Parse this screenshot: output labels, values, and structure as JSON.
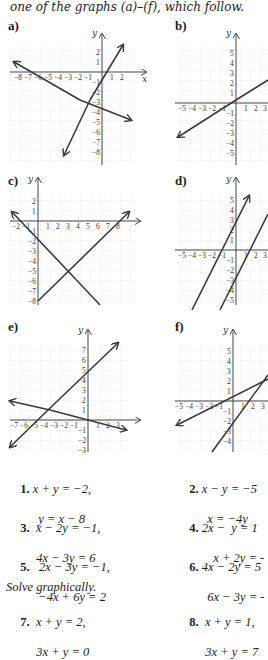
{
  "intro_text": "one of the graphs (a)–(f), which follow.",
  "graphs": [
    {
      "label": "a)",
      "x_ticks": [
        "-8",
        "-7",
        "-6",
        "-5",
        "-4",
        "-3",
        "-2",
        "-1",
        "1",
        "2"
      ],
      "y_ticks": [
        "2",
        "1",
        "-1",
        "-2",
        "-3",
        "-4",
        "-5",
        "-6",
        "-7",
        "-8"
      ]
    },
    {
      "label": "b)",
      "x_ticks": [
        "-5",
        "-4",
        "-3",
        "-2",
        "-1",
        "1",
        "2",
        "3"
      ],
      "y_ticks": [
        "5",
        "4",
        "3",
        "2",
        "1",
        "-1",
        "-2",
        "-3",
        "-4",
        "-5"
      ]
    },
    {
      "label": "c)",
      "x_ticks": [
        "-2",
        "-1",
        "1",
        "2",
        "3",
        "4",
        "5",
        "6",
        "7",
        "8"
      ],
      "y_ticks": [
        "2",
        "1",
        "-1",
        "-2",
        "-3",
        "-4",
        "-5",
        "-6",
        "-7",
        "-8"
      ]
    },
    {
      "label": "d)",
      "x_ticks": [
        "-5",
        "-4",
        "-3",
        "-2",
        "-1",
        "1",
        "2",
        "3"
      ],
      "y_ticks": [
        "5",
        "4",
        "3",
        "2",
        "1",
        "-1",
        "-2",
        "-3",
        "-4",
        "-5"
      ]
    },
    {
      "label": "e)",
      "x_ticks": [
        "-7",
        "-6",
        "-5",
        "-4",
        "-3",
        "-2",
        "-1",
        "1",
        "2",
        "3"
      ],
      "y_ticks": [
        "7",
        "6",
        "5",
        "4",
        "3",
        "2",
        "1",
        "-1",
        "-2",
        "-3"
      ]
    },
    {
      "label": "f)",
      "x_ticks": [
        "-5",
        "-4",
        "-3",
        "-2",
        "-1",
        "1",
        "2",
        "3"
      ],
      "y_ticks": [
        "5",
        "4",
        "3",
        "2",
        "1",
        "-1",
        "-2",
        "-3",
        "-4"
      ]
    }
  ],
  "axis_labels": {
    "x": "x",
    "y": "y"
  },
  "exercises": [
    {
      "num": "1.",
      "eq1": "x + y = −2,",
      "eq2": "y = x − 8"
    },
    {
      "num": "2.",
      "eq1": "x − y = −5",
      "eq2": "x = −4y"
    },
    {
      "num": "3.",
      "eq1": "x − 2y = −1,",
      "eq2": "4x − 3y = 6"
    },
    {
      "num": "4.",
      "eq1": "2x −  y = 1",
      "eq2": "x + 2y = -"
    },
    {
      "num": "5.",
      "eq1": "2x − 3y = −1,",
      "eq2": "−4x + 6y = 2"
    },
    {
      "num": "6.",
      "eq1": "4x − 2y = 5",
      "eq2": "6x − 3y = -"
    },
    {
      "num": "7.",
      "eq1": "x + y = 2,",
      "eq2": "3x + y = 0"
    },
    {
      "num": "8.",
      "eq1": "x + y = 1,",
      "eq2": "3x + y = 7"
    }
  ],
  "section_heading": "Solve graphically.",
  "colors": {
    "grid": "#c8c8c8",
    "axis": "#444444",
    "line": "#3a3a3a"
  }
}
